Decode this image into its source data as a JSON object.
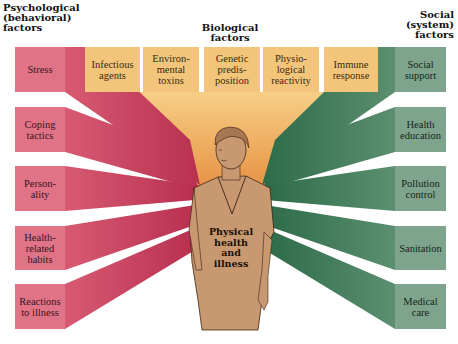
{
  "headings": {
    "psychological": "Psychological\n(behavioral)\nfactors",
    "biological": "Biological\nfactors",
    "social": "Social\n(system)\nfactors"
  },
  "center": {
    "label": "Physical\nhealth\nand\nillness"
  },
  "psychological_factors": [
    {
      "label": "Stress"
    },
    {
      "label": "Coping\ntactics"
    },
    {
      "label": "Person-\nality"
    },
    {
      "label": "Health-\nrelated\nhabits"
    },
    {
      "label": "Reactions\nto illness"
    }
  ],
  "biological_factors": [
    {
      "label": "Infectious\nagents"
    },
    {
      "label": "Environ-\nmental\ntoxins"
    },
    {
      "label": "Genetic\npredis-\nposition"
    },
    {
      "label": "Physio-\nlogical\nreactivity"
    },
    {
      "label": "Immune\nresponse"
    }
  ],
  "social_factors": [
    {
      "label": "Social\nsupport"
    },
    {
      "label": "Health\neducation"
    },
    {
      "label": "Pollution\ncontrol"
    },
    {
      "label": "Sanitation"
    },
    {
      "label": "Medical\ncare"
    }
  ],
  "colors": {
    "psychological": "#e07386",
    "psychological_ray": "#c9445d",
    "biological": "#f3c57a",
    "biological_ray": "#e8944a",
    "social": "#7ea48d",
    "social_ray": "#3f7a58",
    "figure_fill": "#c89870"
  }
}
